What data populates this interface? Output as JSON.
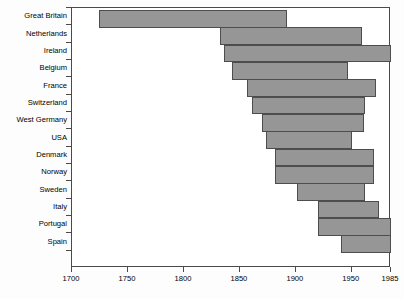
{
  "chart_data": {
    "type": "bar",
    "orientation": "horizontal",
    "title": "",
    "subtitle": "",
    "xlabel": "",
    "ylabel": "",
    "xlim": [
      1700,
      1985
    ],
    "grid": false,
    "legend": null,
    "bar_color": "#969696",
    "bar_border_color": "#4d4d4d",
    "axis_color": "#4a4a4a",
    "background_color": "#ffffff",
    "xticks": [
      1700,
      1750,
      1800,
      1850,
      1900,
      1950,
      1985
    ],
    "xtick_labels": [
      "1700",
      "1750",
      "1800",
      "1850",
      "1900",
      "1950",
      "1985"
    ],
    "categories": [
      "Great Britain",
      "Netherlands",
      "Ireland",
      "Belgium",
      "France",
      "Switzerland",
      "West Germany",
      "USA",
      "Denmark",
      "Norway",
      "Sweden",
      "Italy",
      "Portugal",
      "Spain"
    ],
    "bars": [
      {
        "category": "Great Britain",
        "start": 1724,
        "end": 1892
      },
      {
        "category": "Netherlands",
        "start": 1832,
        "end": 1959
      },
      {
        "category": "Ireland",
        "start": 1836,
        "end": 1985
      },
      {
        "category": "Belgium",
        "start": 1843,
        "end": 1947
      },
      {
        "category": "France",
        "start": 1856,
        "end": 1972
      },
      {
        "category": "Switzerland",
        "start": 1861,
        "end": 1962
      },
      {
        "category": "West Germany",
        "start": 1870,
        "end": 1961
      },
      {
        "category": "USA",
        "start": 1873,
        "end": 1950
      },
      {
        "category": "Denmark",
        "start": 1881,
        "end": 1970
      },
      {
        "category": "Norway",
        "start": 1881,
        "end": 1970
      },
      {
        "category": "Sweden",
        "start": 1901,
        "end": 1962
      },
      {
        "category": "Italy",
        "start": 1920,
        "end": 1974
      },
      {
        "category": "Portugal",
        "start": 1920,
        "end": 1985
      },
      {
        "category": "Spain",
        "start": 1940,
        "end": 1985
      }
    ]
  }
}
